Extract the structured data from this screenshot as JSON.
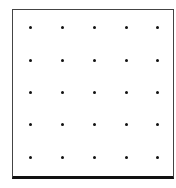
{
  "geoboard": {
    "rows": 5,
    "cols": 5,
    "dot_color": "#111111",
    "border_color": "#444444",
    "dot_x": [
      30,
      62,
      94,
      126,
      157
    ],
    "dot_y": [
      27,
      60,
      92,
      124,
      157
    ]
  }
}
